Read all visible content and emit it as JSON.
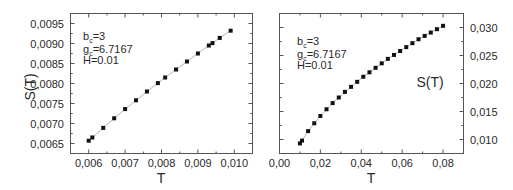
{
  "chart_data": [
    {
      "type": "scatter",
      "panel": "left",
      "title": "",
      "xlabel": "T",
      "ylabel": "S(T)",
      "ylabel_side": "left",
      "xlim": [
        0.0055,
        0.0105
      ],
      "ylim": [
        0.00625,
        0.00975
      ],
      "grid": false,
      "legend": null,
      "xticks": [
        0.006,
        0.007,
        0.008,
        0.009,
        0.01
      ],
      "xtick_labels": [
        "0,006",
        "0,007",
        "0,008",
        "0,009",
        "0,010"
      ],
      "yticks": [
        0.0065,
        0.007,
        0.0075,
        0.008,
        0.0085,
        0.009,
        0.0095
      ],
      "ytick_labels": [
        "0,0065",
        "0,0070",
        "0,0075",
        "0,0080",
        "0,0085",
        "0,0090",
        "0,0095"
      ],
      "annotations": [
        "b_c=3",
        "g_c=6.7167",
        "H=0.01"
      ],
      "series": [
        {
          "name": "S(T)",
          "marker": "square",
          "line": true,
          "x": [
            0.006,
            0.0061,
            0.0064,
            0.0067,
            0.007,
            0.0073,
            0.0076,
            0.0079,
            0.0081,
            0.0084,
            0.0087,
            0.009,
            0.0093,
            0.0094,
            0.0096,
            0.0099
          ],
          "y": [
            0.00657,
            0.00665,
            0.00689,
            0.00713,
            0.00736,
            0.00758,
            0.0078,
            0.00801,
            0.00815,
            0.00835,
            0.00855,
            0.00875,
            0.00895,
            0.00901,
            0.00914,
            0.00932
          ]
        }
      ]
    },
    {
      "type": "scatter",
      "panel": "right",
      "title": "",
      "xlabel": "T",
      "ylabel": "S(T)",
      "ylabel_side": "right",
      "xlim": [
        0.0,
        0.09
      ],
      "ylim": [
        0.0075,
        0.0325
      ],
      "grid": false,
      "legend": null,
      "xticks": [
        0.0,
        0.02,
        0.04,
        0.06,
        0.08
      ],
      "xtick_labels": [
        "0,00",
        "0,02",
        "0,04",
        "0,06",
        "0,08"
      ],
      "yticks": [
        0.01,
        0.015,
        0.02,
        0.025,
        0.03
      ],
      "ytick_labels": [
        "0,010",
        "0,015",
        "0,020",
        "0,025",
        "0,030"
      ],
      "annotations": [
        "b_c=3",
        "g_c=6.7167",
        "H=0.01"
      ],
      "series": [
        {
          "name": "S(T)",
          "marker": "square",
          "line": true,
          "x": [
            0.01,
            0.011,
            0.014,
            0.017,
            0.02,
            0.023,
            0.026,
            0.029,
            0.032,
            0.035,
            0.038,
            0.041,
            0.044,
            0.047,
            0.05,
            0.053,
            0.056,
            0.059,
            0.062,
            0.065,
            0.068,
            0.071,
            0.074,
            0.077,
            0.08
          ],
          "y": [
            0.0093,
            0.0098,
            0.0115,
            0.0129,
            0.0142,
            0.0154,
            0.0165,
            0.0175,
            0.0185,
            0.0194,
            0.0203,
            0.0212,
            0.022,
            0.0228,
            0.0236,
            0.0244,
            0.0251,
            0.0258,
            0.0265,
            0.0272,
            0.0279,
            0.0285,
            0.0291,
            0.0297,
            0.0303
          ]
        }
      ]
    }
  ],
  "panels": {
    "left": {
      "xlabel": "T",
      "ylabel": "S(T)",
      "annot_b_main": "b",
      "annot_b_sub": "c",
      "annot_b_val": "=3",
      "annot_g_main": "g",
      "annot_g_sub": "c",
      "annot_g_val": "=6.7167",
      "annot_h": "H=0.01"
    },
    "right": {
      "xlabel": "T",
      "ylabel": "S(T)",
      "annot_b_main": "b",
      "annot_b_sub": "c",
      "annot_b_val": "=3",
      "annot_g_main": "g",
      "annot_g_sub": "c",
      "annot_g_val": "=6.7167",
      "annot_h": "H=0.01"
    }
  }
}
